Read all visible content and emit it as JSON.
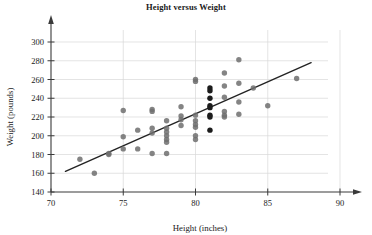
{
  "chart_data": {
    "type": "scatter",
    "title": "Height versus Weight",
    "xlabel": "Height (inches)",
    "ylabel": "Weight (pounds)",
    "xlim": [
      70,
      90
    ],
    "ylim": [
      140,
      300
    ],
    "xticks": [
      70,
      75,
      80,
      85,
      90
    ],
    "yticks": [
      140,
      160,
      180,
      200,
      220,
      240,
      260,
      280,
      300
    ],
    "grid": "horizontal-and-vertical",
    "legend": "none",
    "marker_color": "#6e6e6e",
    "marker_color_dark": "#1c1c1c",
    "line_color": "#232323",
    "grid_color": "#d8d8d8",
    "axis_color": "#3a3a3a",
    "points": [
      {
        "x": 72,
        "y": 175,
        "dark": false
      },
      {
        "x": 73,
        "y": 160,
        "dark": false
      },
      {
        "x": 74,
        "y": 181,
        "dark": false
      },
      {
        "x": 74,
        "y": 180,
        "dark": false
      },
      {
        "x": 75,
        "y": 227,
        "dark": false
      },
      {
        "x": 75,
        "y": 199,
        "dark": false
      },
      {
        "x": 75,
        "y": 186,
        "dark": false
      },
      {
        "x": 76,
        "y": 206,
        "dark": false
      },
      {
        "x": 76,
        "y": 186,
        "dark": false
      },
      {
        "x": 77,
        "y": 228,
        "dark": false
      },
      {
        "x": 77,
        "y": 226,
        "dark": false
      },
      {
        "x": 77,
        "y": 208,
        "dark": false
      },
      {
        "x": 77,
        "y": 203,
        "dark": false
      },
      {
        "x": 77,
        "y": 181,
        "dark": false
      },
      {
        "x": 78,
        "y": 216,
        "dark": false
      },
      {
        "x": 78,
        "y": 208,
        "dark": false
      },
      {
        "x": 78,
        "y": 204,
        "dark": false
      },
      {
        "x": 78,
        "y": 200,
        "dark": false
      },
      {
        "x": 78,
        "y": 196,
        "dark": false
      },
      {
        "x": 78,
        "y": 193,
        "dark": false
      },
      {
        "x": 78,
        "y": 181,
        "dark": false
      },
      {
        "x": 79,
        "y": 231,
        "dark": false
      },
      {
        "x": 79,
        "y": 221,
        "dark": false
      },
      {
        "x": 79,
        "y": 217,
        "dark": false
      },
      {
        "x": 79,
        "y": 211,
        "dark": false
      },
      {
        "x": 80,
        "y": 260,
        "dark": false
      },
      {
        "x": 80,
        "y": 258,
        "dark": false
      },
      {
        "x": 80,
        "y": 222,
        "dark": false
      },
      {
        "x": 80,
        "y": 216,
        "dark": false
      },
      {
        "x": 80,
        "y": 212,
        "dark": false
      },
      {
        "x": 80,
        "y": 209,
        "dark": false
      },
      {
        "x": 80,
        "y": 200,
        "dark": false
      },
      {
        "x": 80,
        "y": 196,
        "dark": false
      },
      {
        "x": 81,
        "y": 251,
        "dark": true
      },
      {
        "x": 81,
        "y": 248,
        "dark": true
      },
      {
        "x": 81,
        "y": 240,
        "dark": true
      },
      {
        "x": 81,
        "y": 232,
        "dark": true
      },
      {
        "x": 81,
        "y": 230,
        "dark": true
      },
      {
        "x": 81,
        "y": 222,
        "dark": true
      },
      {
        "x": 81,
        "y": 220,
        "dark": true
      },
      {
        "x": 81,
        "y": 206,
        "dark": true
      },
      {
        "x": 82,
        "y": 267,
        "dark": false
      },
      {
        "x": 82,
        "y": 253,
        "dark": false
      },
      {
        "x": 82,
        "y": 241,
        "dark": false
      },
      {
        "x": 82,
        "y": 226,
        "dark": false
      },
      {
        "x": 82,
        "y": 222,
        "dark": false
      },
      {
        "x": 82,
        "y": 220,
        "dark": false
      },
      {
        "x": 83,
        "y": 281,
        "dark": false
      },
      {
        "x": 83,
        "y": 256,
        "dark": false
      },
      {
        "x": 83,
        "y": 236,
        "dark": false
      },
      {
        "x": 83,
        "y": 223,
        "dark": false
      },
      {
        "x": 84,
        "y": 251,
        "dark": false
      },
      {
        "x": 85,
        "y": 232,
        "dark": false
      },
      {
        "x": 87,
        "y": 261,
        "dark": false
      }
    ],
    "trendline": {
      "x1": 71,
      "y1": 162,
      "x2": 88,
      "y2": 278
    }
  }
}
